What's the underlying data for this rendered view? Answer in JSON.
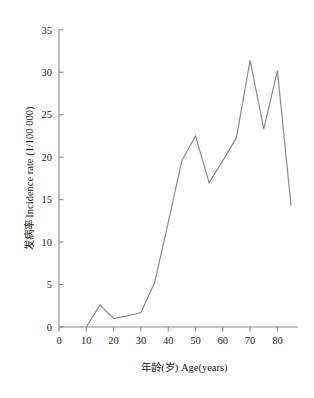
{
  "chart_data": {
    "type": "line",
    "title": "",
    "xlabel": "年龄(岁) Age(years)",
    "ylabel": "发病率 Incidence  rate (1/100 000)",
    "xlim": [
      0,
      90
    ],
    "ylim": [
      0,
      35
    ],
    "xticks": [
      0,
      10,
      20,
      30,
      40,
      50,
      60,
      70,
      80
    ],
    "yticks": [
      0,
      5,
      10,
      15,
      20,
      25,
      30,
      35
    ],
    "xtick_labels": [
      "0",
      "10",
      "20",
      "30",
      "40",
      "50",
      "60",
      "70",
      "80"
    ],
    "ytick_labels": [
      "0",
      "5",
      "10",
      "15",
      "20",
      "25",
      "30",
      "35"
    ],
    "grid": false,
    "legend": false,
    "line_color": "#8c8c8c",
    "x": [
      10,
      15,
      20,
      25,
      30,
      35,
      40,
      45,
      50,
      55,
      60,
      65,
      70,
      75,
      80,
      85
    ],
    "values": [
      0.0,
      2.6,
      1.0,
      1.3,
      1.7,
      5.2,
      12.3,
      19.6,
      22.5,
      17.0,
      19.6,
      22.3,
      31.4,
      23.3,
      30.2,
      14.3
    ],
    "series": [
      {
        "name": "Incidence rate",
        "values": [
          0.0,
          2.6,
          1.0,
          1.3,
          1.7,
          5.2,
          12.3,
          19.6,
          22.5,
          17.0,
          19.6,
          22.3,
          31.4,
          23.3,
          30.2,
          14.3
        ]
      }
    ]
  },
  "figure": {
    "background": "#ffffff",
    "axis_color": "#8a8a8a",
    "text_color": "#1a1a1a",
    "bottom_caption": ""
  }
}
